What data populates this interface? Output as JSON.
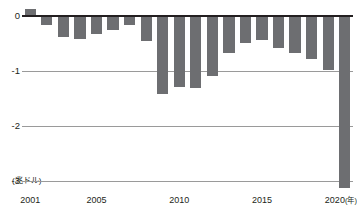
{
  "chart_data": {
    "type": "bar",
    "title": "",
    "xlabel": "年",
    "ylabel": "兆ドル",
    "y_unit_label": "(兆ドル)",
    "x_unit_label": "(年)",
    "ylim": [
      -3.2,
      0.25
    ],
    "grid": true,
    "legend": "none",
    "bar_color": "#6d6e71",
    "zero_line_color": "#231f20",
    "gridline_color": "#9a9a9a",
    "y_ticks": [
      {
        "value": 0,
        "label": "0"
      },
      {
        "value": -1,
        "label": "-1"
      },
      {
        "value": -2,
        "label": "-2"
      },
      {
        "value": -3,
        "label": "-3"
      }
    ],
    "x_ticks": [
      {
        "value": 2001,
        "label": "2001"
      },
      {
        "value": 2005,
        "label": "2005"
      },
      {
        "value": 2010,
        "label": "2010"
      },
      {
        "value": 2015,
        "label": "2015"
      },
      {
        "value": 2020,
        "label": "2020"
      }
    ],
    "categories": [
      "2001",
      "2002",
      "2003",
      "2004",
      "2005",
      "2006",
      "2007",
      "2008",
      "2009",
      "2010",
      "2011",
      "2012",
      "2013",
      "2014",
      "2015",
      "2016",
      "2017",
      "2018",
      "2019",
      "2020"
    ],
    "values": [
      0.13,
      -0.16,
      -0.38,
      -0.41,
      -0.32,
      -0.25,
      -0.16,
      -0.46,
      -1.41,
      -1.29,
      -1.3,
      -1.09,
      -0.68,
      -0.49,
      -0.44,
      -0.59,
      -0.67,
      -0.78,
      -0.98,
      -3.13
    ]
  }
}
